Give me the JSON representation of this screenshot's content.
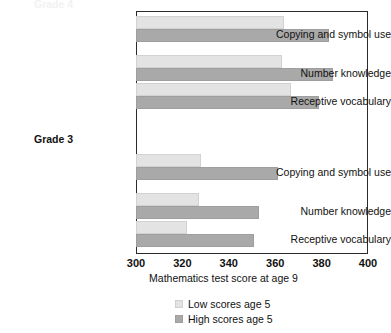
{
  "chart_data": {
    "type": "bar",
    "orientation": "horizontal",
    "title": "",
    "xlabel": "Mathematics test score at age 9",
    "ylabel": "",
    "xlim": [
      300,
      400
    ],
    "xticks": [
      300,
      320,
      340,
      360,
      380,
      400
    ],
    "grid": false,
    "legend_position": "bottom",
    "series": [
      {
        "name": "Low scores age 5",
        "color": "#e3e3e3"
      },
      {
        "name": "High scores age 5",
        "color": "#a9a9a9"
      }
    ],
    "groups": [
      {
        "label": "Grade 4",
        "label_visible": false,
        "categories": [
          "Receptive vocabulary",
          "Number knowledge",
          "Copying and symbol use"
        ],
        "rows": [
          {
            "category": "Copying and symbol use",
            "low": 364,
            "high": 383
          },
          {
            "category": "Number knowledge",
            "low": 363,
            "high": 385
          },
          {
            "category": "Receptive vocabulary",
            "low": 367,
            "high": 379
          }
        ]
      },
      {
        "label": "Grade 3",
        "label_visible": true,
        "categories": [
          "Receptive vocabulary",
          "Number knowledge",
          "Copying and symbol use"
        ],
        "rows": [
          {
            "category": "Copying and symbol use",
            "low": 328,
            "high": 361
          },
          {
            "category": "Number knowledge",
            "low": 327,
            "high": 353
          },
          {
            "category": "Receptive vocabulary",
            "low": 322,
            "high": 351
          }
        ]
      }
    ]
  },
  "axis": {
    "ticks": [
      {
        "value": "300"
      },
      {
        "value": "320"
      },
      {
        "value": "340"
      },
      {
        "value": "360"
      },
      {
        "value": "380"
      },
      {
        "value": "400"
      }
    ],
    "title": "Mathematics test score at age 9"
  },
  "labels": {
    "g4_row1": "Copying and symbol use",
    "g4_row2": "Number knowledge",
    "g4_row3": "Receptive vocabulary",
    "group_grade3": "Grade 3",
    "g3_row1": "Copying and symbol use",
    "g3_row2": "Number knowledge",
    "g3_row3": "Receptive vocabulary",
    "top_cut_title": "Grade 4"
  },
  "legend": {
    "items": [
      {
        "label": "Low scores age 5",
        "color": "#e3e3e3"
      },
      {
        "label": "High scores age 5",
        "color": "#a9a9a9"
      }
    ]
  }
}
